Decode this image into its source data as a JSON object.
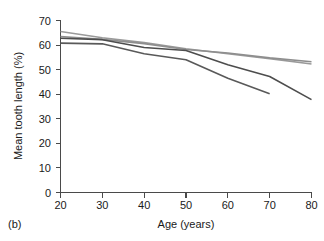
{
  "figure": {
    "panel_label": "(b)",
    "background_color": "#ffffff"
  },
  "chart_data": {
    "type": "line",
    "title": "",
    "subtitle": "",
    "xlabel": "Age (years)",
    "ylabel": "Mean tooth length (%)",
    "xlim": [
      20,
      80
    ],
    "ylim": [
      0,
      70
    ],
    "xticks": [
      20,
      30,
      40,
      50,
      60,
      70,
      80
    ],
    "xtick_labels": [
      "20",
      "30",
      "40",
      "50",
      "60",
      "70",
      "80"
    ],
    "yticks": [
      0,
      10,
      20,
      30,
      40,
      50,
      60,
      70
    ],
    "ytick_labels": [
      "0",
      "10",
      "20",
      "30",
      "40",
      "50",
      "60",
      "70"
    ],
    "grid": false,
    "legend": false,
    "legend_position": "none",
    "annotations": [
      "(b)"
    ],
    "series": [
      {
        "name": "series-1",
        "color": "#9a9a9a",
        "line_width": 1.6,
        "x": [
          20,
          30,
          40,
          50,
          60,
          70,
          80
        ],
        "values": [
          65.5,
          63.0,
          61.0,
          58.5,
          56.5,
          54.5,
          52.3
        ]
      },
      {
        "name": "series-2",
        "color": "#8e8e8e",
        "line_width": 1.6,
        "x": [
          20,
          30,
          40,
          50,
          60,
          70,
          80
        ],
        "values": [
          63.5,
          62.3,
          60.6,
          58.2,
          56.8,
          54.8,
          53.2
        ]
      },
      {
        "name": "series-3",
        "color": "#4d4d4d",
        "line_width": 1.6,
        "x": [
          20,
          30,
          40,
          50,
          60,
          70,
          80
        ],
        "values": [
          62.8,
          62.2,
          59.0,
          57.8,
          52.0,
          47.2,
          37.8
        ]
      },
      {
        "name": "series-4",
        "color": "#595959",
        "line_width": 1.6,
        "x": [
          20,
          30,
          40,
          50,
          60,
          70
        ],
        "values": [
          60.8,
          60.5,
          56.5,
          54.0,
          46.5,
          40.2
        ]
      }
    ]
  }
}
